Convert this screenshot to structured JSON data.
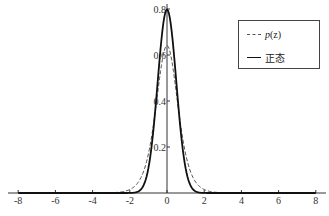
{
  "chart_data": {
    "type": "line",
    "title": "",
    "xlabel": "",
    "ylabel": "",
    "xlim": [
      -8,
      8
    ],
    "ylim": [
      0,
      0.8
    ],
    "x_ticks": [
      -8,
      -6,
      -4,
      -2,
      0,
      2,
      4,
      6,
      8
    ],
    "x_tick_labels": [
      "-8",
      "-6",
      "-4",
      "-2",
      "0",
      "2",
      "4",
      "6",
      "8"
    ],
    "y_ticks": [
      0.2,
      0.4,
      0.6,
      0.8
    ],
    "y_tick_labels": [
      "0.2",
      "0.4",
      "0.6",
      "0.8"
    ],
    "grid": false,
    "legend_position": "upper right",
    "series": [
      {
        "name": "p(z)",
        "style": "dashed",
        "color": "#555555",
        "description": "logistic-like density, peak ~0.64 at z=0, heavier tails reaching ~0 near |z|=5",
        "x": [
          -8,
          -6,
          -5,
          -4,
          -3,
          -2,
          -1.5,
          -1,
          -0.5,
          0,
          0.5,
          1,
          1.5,
          2,
          3,
          4,
          5,
          6,
          8
        ],
        "values": [
          0.0,
          0.0,
          0.007,
          0.018,
          0.05,
          0.13,
          0.22,
          0.36,
          0.54,
          0.64,
          0.54,
          0.36,
          0.22,
          0.13,
          0.05,
          0.018,
          0.007,
          0.0,
          0.0
        ]
      },
      {
        "name": "正态",
        "style": "solid",
        "color": "#111111",
        "description": "normal density, mean 0, sigma ~0.5, peak ~0.80",
        "x": [
          -8,
          -3,
          -2,
          -1.5,
          -1,
          -0.5,
          0,
          0.5,
          1,
          1.5,
          2,
          3,
          8
        ],
        "values": [
          0.0,
          0.0,
          0.0003,
          0.009,
          0.108,
          0.484,
          0.798,
          0.484,
          0.108,
          0.009,
          0.0003,
          0.0,
          0.0
        ]
      }
    ]
  },
  "legend": {
    "item1_prefix": "p",
    "item1_suffix": "(z)",
    "item2_label": "正态"
  },
  "axes": {
    "x_tick_labels": [
      "-8",
      "-6",
      "-4",
      "-2",
      "0",
      "2",
      "4",
      "6",
      "8"
    ],
    "y_tick_labels": [
      "0.2",
      "0.4",
      "0.6",
      "0.8"
    ]
  }
}
